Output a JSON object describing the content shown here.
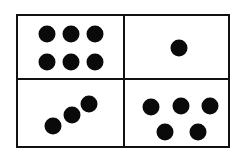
{
  "diagram": {
    "colors": {
      "ink": "#111111",
      "dot": "#0a0a0a",
      "background": "#ffffff"
    },
    "panels": [
      {
        "id": "top-left",
        "count": 6,
        "dots": [
          [
            47,
            34
          ],
          [
            71,
            34
          ],
          [
            95,
            34
          ],
          [
            47,
            62
          ],
          [
            71,
            62
          ],
          [
            95,
            62
          ]
        ]
      },
      {
        "id": "top-right",
        "count": 1,
        "dots": [
          [
            179,
            48
          ]
        ]
      },
      {
        "id": "bottom-left",
        "count": 3,
        "dots": [
          [
            53,
            126
          ],
          [
            72,
            115
          ],
          [
            89,
            104
          ]
        ]
      },
      {
        "id": "bottom-right",
        "count": 5,
        "dots": [
          [
            151,
            107
          ],
          [
            181,
            106
          ],
          [
            210,
            106
          ],
          [
            165,
            132
          ],
          [
            198,
            132
          ]
        ]
      }
    ]
  }
}
